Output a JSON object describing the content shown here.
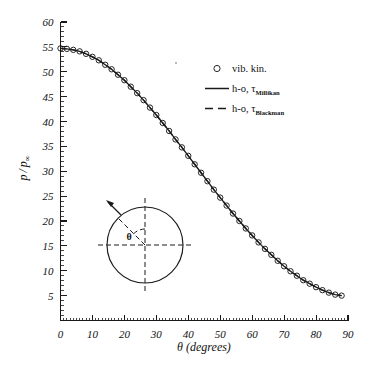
{
  "chart_data": {
    "type": "line",
    "title": "",
    "xlabel": "θ (degrees)",
    "ylabel": "p / p∞",
    "xlim": [
      0,
      90
    ],
    "ylim": [
      0,
      60
    ],
    "xticks": [
      0,
      10,
      20,
      30,
      40,
      50,
      60,
      70,
      80,
      90
    ],
    "yticks": [
      5,
      10,
      15,
      20,
      25,
      30,
      35,
      40,
      45,
      50,
      55,
      60
    ],
    "xtick_minor_step": 1,
    "ytick_minor_step": 1,
    "grid": false,
    "legend_position": "upper right",
    "series": [
      {
        "name": "vib. kin.",
        "marker": "open-circle",
        "linestyle": "none",
        "x": [
          0,
          2,
          4,
          6,
          8,
          10,
          12,
          14,
          16,
          18,
          20,
          22,
          24,
          26,
          28,
          30,
          32,
          34,
          36,
          38,
          40,
          42,
          44,
          46,
          48,
          50,
          52,
          54,
          56,
          58,
          60,
          62,
          64,
          66,
          68,
          70,
          72,
          74,
          76,
          78,
          80,
          82,
          84,
          86,
          88
        ],
        "y": [
          54.7,
          54.6,
          54.4,
          54.1,
          53.6,
          53.0,
          52.3,
          51.4,
          50.5,
          49.4,
          48.3,
          47.0,
          45.7,
          44.3,
          42.8,
          41.3,
          39.7,
          38.1,
          36.4,
          34.8,
          33.1,
          31.4,
          29.7,
          28.0,
          26.3,
          24.7,
          23.1,
          21.5,
          20.0,
          18.5,
          17.1,
          15.7,
          14.4,
          13.2,
          12.0,
          10.9,
          9.9,
          9.0,
          8.1,
          7.4,
          6.7,
          6.1,
          5.6,
          5.2,
          5.0
        ]
      },
      {
        "name": "h-o, τ_Millikan",
        "marker": "none",
        "linestyle": "solid",
        "x": [
          0,
          2,
          4,
          6,
          8,
          10,
          12,
          14,
          16,
          18,
          20,
          22,
          24,
          26,
          28,
          30,
          32,
          34,
          36,
          38,
          40,
          42,
          44,
          46,
          48,
          50,
          52,
          54,
          56,
          58,
          60,
          62,
          64,
          66,
          68,
          70,
          72,
          74,
          76,
          78,
          80,
          82,
          84,
          86,
          88
        ],
        "y": [
          54.7,
          54.6,
          54.4,
          54.1,
          53.6,
          53.0,
          52.3,
          51.4,
          50.5,
          49.4,
          48.3,
          47.0,
          45.7,
          44.3,
          42.8,
          41.3,
          39.7,
          38.1,
          36.4,
          34.8,
          33.1,
          31.4,
          29.7,
          28.0,
          26.3,
          24.7,
          23.1,
          21.5,
          20.0,
          18.5,
          17.1,
          15.7,
          14.4,
          13.2,
          12.0,
          10.9,
          9.9,
          9.0,
          8.1,
          7.4,
          6.7,
          6.1,
          5.6,
          5.2,
          5.0
        ]
      },
      {
        "name": "h-o, τ_Blackman",
        "marker": "none",
        "linestyle": "dashed",
        "x": [
          0,
          2,
          4,
          6,
          8,
          10,
          12,
          14,
          16,
          18,
          20,
          22,
          24,
          26,
          28,
          30,
          32,
          34,
          36,
          38,
          40,
          42,
          44,
          46,
          48,
          50,
          52,
          54,
          56,
          58,
          60,
          62,
          64,
          66,
          68,
          70,
          72,
          74,
          76,
          78,
          80,
          82,
          84,
          86,
          88
        ],
        "y": [
          54.7,
          54.6,
          54.4,
          54.1,
          53.6,
          53.0,
          52.3,
          51.4,
          50.5,
          49.4,
          48.3,
          47.0,
          45.7,
          44.3,
          42.8,
          41.3,
          39.7,
          38.1,
          36.4,
          34.8,
          33.1,
          31.4,
          29.7,
          28.0,
          26.3,
          24.7,
          23.1,
          21.5,
          20.0,
          18.5,
          17.1,
          15.7,
          14.4,
          13.2,
          12.0,
          10.9,
          9.9,
          9.0,
          8.1,
          7.4,
          6.7,
          6.1,
          5.6,
          5.2,
          5.0
        ]
      }
    ]
  },
  "axes": {
    "x_title": "θ (degrees)",
    "y_title_num": "p",
    "y_title_slash": "/",
    "y_title_den": "p",
    "y_title_den_sub": "∞",
    "xtick_labels": [
      "0",
      "10",
      "20",
      "30",
      "40",
      "50",
      "60",
      "70",
      "80",
      "90"
    ],
    "ytick_labels": [
      "5",
      "10",
      "15",
      "20",
      "25",
      "30",
      "35",
      "40",
      "45",
      "50",
      "55",
      "60"
    ],
    "origin_label": "0"
  },
  "legend": {
    "entries": [
      {
        "label": "vib. kin.",
        "sub": "",
        "symbol": "open-circle"
      },
      {
        "label": "h-o, τ",
        "sub": "Millikan",
        "symbol": "solid-line"
      },
      {
        "label": "h-o, τ",
        "sub": "Blackman",
        "symbol": "dashed-line"
      }
    ]
  },
  "inset": {
    "angle_label": "θ",
    "description": "circle-with-angle-sketch"
  },
  "colors": {
    "ink": "#1a1a1a",
    "background": "#ffffff"
  }
}
